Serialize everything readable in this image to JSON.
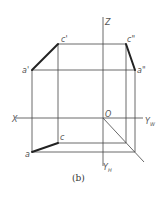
{
  "diagram": {
    "caption": "(b)",
    "axes": {
      "x": "X",
      "z": "Z",
      "origin": "O",
      "yw": "Y",
      "yw_sub": "W",
      "yh": "Y",
      "yh_sub": "H"
    },
    "points": {
      "a_prime": "a'",
      "c_prime": "c'",
      "c_double": "c\"",
      "a_double": "a\"",
      "a": "a",
      "c": "c"
    },
    "colors": {
      "thin_line": "#444444",
      "thick_line": "#222222",
      "label": "#555555"
    }
  }
}
